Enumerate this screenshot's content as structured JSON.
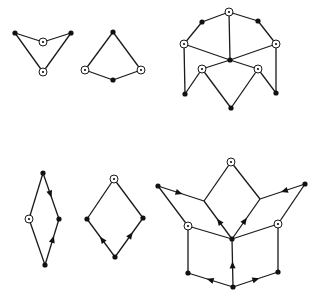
{
  "figure": {
    "colors": {
      "ink": "#1a1a1a",
      "background": "#ffffff"
    },
    "graphs": [
      {
        "id": "g1",
        "vertices": [
          {
            "id": "a",
            "x": 15,
            "y": 33,
            "type": "dot"
          },
          {
            "id": "b",
            "x": 71,
            "y": 33,
            "type": "dot"
          },
          {
            "id": "c",
            "x": 43,
            "y": 42,
            "type": "circled"
          },
          {
            "id": "d",
            "x": 43,
            "y": 72,
            "type": "circled"
          }
        ],
        "edges": [
          [
            "a",
            "c"
          ],
          [
            "c",
            "b"
          ],
          [
            "a",
            "d"
          ],
          [
            "b",
            "d"
          ]
        ],
        "arrows": []
      },
      {
        "id": "g2",
        "vertices": [
          {
            "id": "a",
            "x": 113,
            "y": 32,
            "type": "dot"
          },
          {
            "id": "b",
            "x": 85,
            "y": 70,
            "type": "circled"
          },
          {
            "id": "c",
            "x": 113,
            "y": 80,
            "type": "dot"
          },
          {
            "id": "d",
            "x": 141,
            "y": 70,
            "type": "circled"
          }
        ],
        "edges": [
          [
            "a",
            "b"
          ],
          [
            "b",
            "c"
          ],
          [
            "c",
            "d"
          ],
          [
            "d",
            "a"
          ]
        ],
        "arrows": []
      },
      {
        "id": "g3",
        "vertices": [
          {
            "id": "top",
            "x": 229,
            "y": 12,
            "type": "circled"
          },
          {
            "id": "ul",
            "x": 202,
            "y": 22,
            "type": "dot"
          },
          {
            "id": "ur",
            "x": 258,
            "y": 21,
            "type": "dot"
          },
          {
            "id": "l",
            "x": 184,
            "y": 44,
            "type": "circled"
          },
          {
            "id": "r",
            "x": 276,
            "y": 44,
            "type": "circled"
          },
          {
            "id": "c",
            "x": 230,
            "y": 60,
            "type": "dot"
          },
          {
            "id": "il",
            "x": 202,
            "y": 69,
            "type": "circled"
          },
          {
            "id": "ir",
            "x": 258,
            "y": 69,
            "type": "circled"
          },
          {
            "id": "bl",
            "x": 185,
            "y": 94,
            "type": "dot"
          },
          {
            "id": "br",
            "x": 276,
            "y": 93,
            "type": "dot"
          },
          {
            "id": "bm",
            "x": 231,
            "y": 108,
            "type": "dot"
          }
        ],
        "edges": [
          [
            "top",
            "ul"
          ],
          [
            "top",
            "ur"
          ],
          [
            "ul",
            "l"
          ],
          [
            "ur",
            "r"
          ],
          [
            "top",
            "c"
          ],
          [
            "l",
            "c"
          ],
          [
            "r",
            "c"
          ],
          [
            "c",
            "il"
          ],
          [
            "c",
            "ir"
          ],
          [
            "l",
            "bl"
          ],
          [
            "r",
            "br"
          ],
          [
            "bl",
            "il"
          ],
          [
            "il",
            "bm"
          ],
          [
            "bm",
            "ir"
          ],
          [
            "ir",
            "br"
          ]
        ],
        "arrows": []
      },
      {
        "id": "g4",
        "vertices": [
          {
            "id": "t",
            "x": 43,
            "y": 173,
            "type": "dot"
          },
          {
            "id": "l",
            "x": 29,
            "y": 219,
            "type": "circled"
          },
          {
            "id": "r",
            "x": 59,
            "y": 219,
            "type": "dot"
          },
          {
            "id": "b",
            "x": 45,
            "y": 265,
            "type": "dot"
          }
        ],
        "edges": [
          [
            "t",
            "l"
          ],
          [
            "t",
            "r"
          ],
          [
            "l",
            "b"
          ],
          [
            "b",
            "r"
          ]
        ],
        "arrows": [
          {
            "from": "t",
            "to": "r",
            "at": 0.45
          },
          {
            "from": "b",
            "to": "r",
            "at": 0.55
          }
        ]
      },
      {
        "id": "g5",
        "vertices": [
          {
            "id": "t",
            "x": 114,
            "y": 179,
            "type": "circled"
          },
          {
            "id": "l",
            "x": 87,
            "y": 219,
            "type": "dot"
          },
          {
            "id": "r",
            "x": 143,
            "y": 218,
            "type": "dot"
          },
          {
            "id": "b",
            "x": 115,
            "y": 257,
            "type": "dot"
          }
        ],
        "edges": [
          [
            "t",
            "l"
          ],
          [
            "t",
            "r"
          ],
          [
            "l",
            "b"
          ],
          [
            "b",
            "r"
          ]
        ],
        "arrows": [
          {
            "from": "b",
            "to": "l",
            "at": 0.45
          },
          {
            "from": "b",
            "to": "r",
            "at": 0.55
          }
        ]
      },
      {
        "id": "g6",
        "vertices": [
          {
            "id": "top",
            "x": 231,
            "y": 162,
            "type": "circled"
          },
          {
            "id": "fl",
            "x": 158,
            "y": 186,
            "type": "dot"
          },
          {
            "id": "fr",
            "x": 305,
            "y": 184,
            "type": "dot"
          },
          {
            "id": "jl",
            "x": 204,
            "y": 201,
            "type": "corner"
          },
          {
            "id": "jr",
            "x": 260,
            "y": 199,
            "type": "corner"
          },
          {
            "id": "l",
            "x": 188,
            "y": 226,
            "type": "circled"
          },
          {
            "id": "r",
            "x": 278,
            "y": 224,
            "type": "circled"
          },
          {
            "id": "c",
            "x": 232,
            "y": 239,
            "type": "dot"
          },
          {
            "id": "bl",
            "x": 188,
            "y": 273,
            "type": "dot"
          },
          {
            "id": "br",
            "x": 278,
            "y": 272,
            "type": "dot"
          },
          {
            "id": "b",
            "x": 233,
            "y": 287,
            "type": "dot"
          }
        ],
        "edges": [
          [
            "top",
            "jl"
          ],
          [
            "top",
            "jr"
          ],
          [
            "fl",
            "jl"
          ],
          [
            "fr",
            "jr"
          ],
          [
            "fl",
            "l"
          ],
          [
            "fr",
            "r"
          ],
          [
            "jl",
            "c"
          ],
          [
            "jr",
            "c"
          ],
          [
            "l",
            "c"
          ],
          [
            "r",
            "c"
          ],
          [
            "l",
            "bl"
          ],
          [
            "r",
            "br"
          ],
          [
            "bl",
            "b"
          ],
          [
            "b",
            "br"
          ],
          [
            "b",
            "c"
          ]
        ],
        "arrows": [
          {
            "from": "fl",
            "to": "jl",
            "at": 0.45
          },
          {
            "from": "fr",
            "to": "jr",
            "at": 0.45
          },
          {
            "from": "c",
            "to": "jl",
            "at": 0.45
          },
          {
            "from": "c",
            "to": "jr",
            "at": 0.45
          },
          {
            "from": "b",
            "to": "c",
            "at": 0.45
          },
          {
            "from": "b",
            "to": "bl",
            "at": 0.5
          },
          {
            "from": "b",
            "to": "br",
            "at": 0.5
          }
        ]
      }
    ]
  }
}
